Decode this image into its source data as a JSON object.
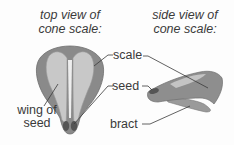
{
  "diagram": {
    "top_view": {
      "title_line1": "top view of",
      "title_line2": "cone scale:",
      "labels": {
        "wing": "wing of",
        "wing2": "seed"
      }
    },
    "side_view": {
      "title_line1": "side view of",
      "title_line2": "cone scale:"
    },
    "shared_labels": {
      "scale": "scale",
      "seed": "seed",
      "bract": "bract"
    },
    "colors": {
      "scale_outer": "#8a8a8a",
      "scale_inner": "#b8b8b8",
      "seed_wing": "#cfcfcf",
      "seed_body": "#5a5a5a",
      "line": "#3a3a3a"
    }
  }
}
